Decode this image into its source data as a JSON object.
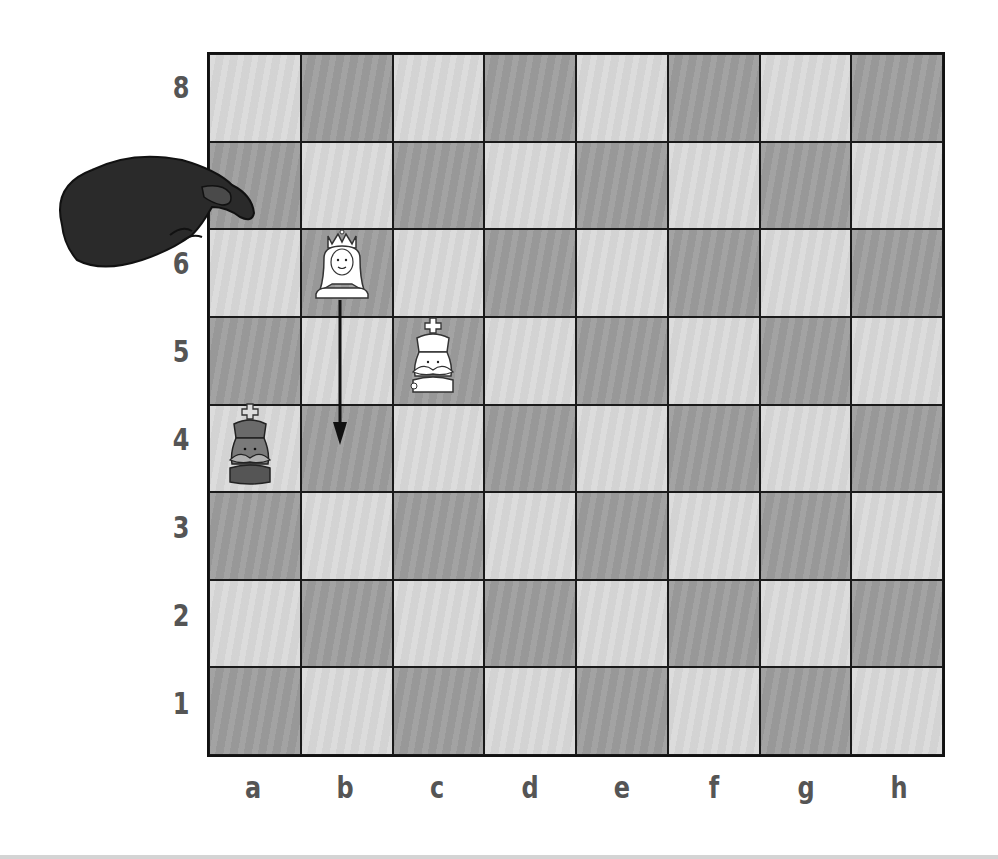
{
  "board": {
    "files": [
      "a",
      "b",
      "c",
      "d",
      "e",
      "f",
      "g",
      "h"
    ],
    "ranks": [
      "8",
      "7",
      "6",
      "5",
      "4",
      "3",
      "2",
      "1"
    ],
    "light_color": "#dadada",
    "dark_color": "#9d9d9d"
  },
  "labels": {
    "rank_8": "8",
    "rank_7": "7",
    "rank_6": "6",
    "rank_5": "5",
    "rank_4": "4",
    "rank_3": "3",
    "rank_2": "2",
    "rank_1": "1",
    "file_a": "a",
    "file_b": "b",
    "file_c": "c",
    "file_d": "d",
    "file_e": "e",
    "file_f": "f",
    "file_g": "g",
    "file_h": "h"
  },
  "pieces": [
    {
      "name": "white-queen",
      "color": "white",
      "type": "queen",
      "square": "b6"
    },
    {
      "name": "white-king",
      "color": "white",
      "type": "king",
      "square": "c5"
    },
    {
      "name": "black-king",
      "color": "black",
      "type": "king",
      "square": "a4"
    }
  ],
  "move_arrow": {
    "from": "b6",
    "to": "b4"
  },
  "hand": {
    "points_at": "a7"
  }
}
